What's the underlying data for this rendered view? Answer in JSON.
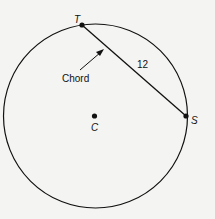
{
  "diagram": {
    "points": {
      "T": {
        "label": "T"
      },
      "S": {
        "label": "S"
      },
      "C": {
        "label": "C"
      }
    },
    "chord_label": "Chord",
    "chord_length": "12",
    "colors": {
      "stroke": "#111111",
      "background": "#f4f4f2"
    }
  }
}
